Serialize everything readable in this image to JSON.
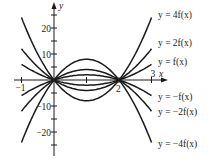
{
  "figure": {
    "x_axis_label": "x",
    "y_axis_label": "y",
    "x_ticks": [
      {
        "value": -1,
        "label": "−1"
      },
      {
        "value": 2,
        "label": "2"
      },
      {
        "value": 3,
        "label": "3"
      }
    ],
    "y_ticks": [
      {
        "value": 20,
        "label": "20"
      },
      {
        "value": 10,
        "label": "10"
      },
      {
        "value": -10,
        "label": "−10"
      },
      {
        "value": -20,
        "label": "−20"
      }
    ],
    "base_function": "f(x) = 2x(x - 2)",
    "curves": [
      {
        "id": "4f",
        "k": 4,
        "label": "y = 4f(x)"
      },
      {
        "id": "2f",
        "k": 2,
        "label": "y = 2f(x)"
      },
      {
        "id": "f",
        "k": 1,
        "label": "y = f(x)"
      },
      {
        "id": "neg-f",
        "k": -1,
        "label": "y = −f(x)"
      },
      {
        "id": "neg-2f",
        "k": -2,
        "label": "y = −2f(x)"
      },
      {
        "id": "neg-4f",
        "k": -4,
        "label": "y = −4f(x)"
      }
    ],
    "x_range": [
      -1,
      3
    ],
    "line_color": "#1a1a1a"
  }
}
